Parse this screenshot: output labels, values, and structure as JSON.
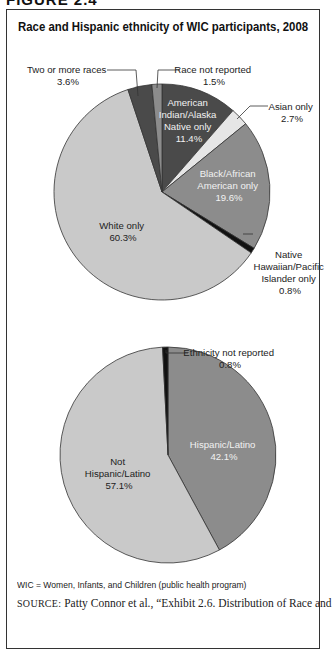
{
  "figure_label": "FIGURE 2.4",
  "title": "Race and Hispanic ethnicity of WIC participants, 2008",
  "note": "WIC = Women, Infants, and Children (public health program)",
  "source": {
    "label": "SOURCE:",
    "text": "Patty Connor et al., “Exhibit 2.6. Distribution of Race and"
  },
  "colors": {
    "dark": "#4a4a4a",
    "medium": "#8c8c8c",
    "light": "#c9c9c9",
    "lighter": "#e6e6e6",
    "black": "#111111",
    "outline": "#333333"
  },
  "chart_data": [
    {
      "type": "pie",
      "title": "Race",
      "start_angle": "12 o'clock, clockwise",
      "categories": [
        "American Indian/Alaska Native only",
        "Asian only",
        "Black/African American only",
        "Native Hawaiian/Pacific Islander only",
        "White only",
        "Two or more races",
        "Race not reported"
      ],
      "values": [
        11.4,
        2.7,
        19.6,
        0.8,
        60.3,
        3.6,
        1.5
      ],
      "unit": "%",
      "labels": [
        {
          "lines": [
            "American",
            "Indian/Alaska",
            "Native only",
            "11.4%"
          ]
        },
        {
          "lines": [
            "Asian only",
            "2.7%"
          ]
        },
        {
          "lines": [
            "Black/African",
            "American only",
            "19.6%"
          ]
        },
        {
          "lines": [
            "Native",
            "Hawaiian/Pacific",
            "Islander only",
            "0.8%"
          ]
        },
        {
          "lines": [
            "White only",
            "60.3%"
          ]
        },
        {
          "lines": [
            "Two or more races",
            "3.6%"
          ]
        },
        {
          "lines": [
            "Race not reported",
            "1.5%"
          ]
        }
      ]
    },
    {
      "type": "pie",
      "title": "Hispanic ethnicity",
      "start_angle": "12 o'clock, clockwise",
      "categories": [
        "Hispanic/Latino",
        "Not Hispanic/Latino",
        "Ethnicity not reported"
      ],
      "values": [
        42.1,
        57.1,
        0.8
      ],
      "unit": "%",
      "labels": [
        {
          "lines": [
            "Hispanic/Latino",
            "42.1%"
          ]
        },
        {
          "lines": [
            "Not",
            "Hispanic/Latino",
            "57.1%"
          ]
        },
        {
          "lines": [
            "Ethnicity not reported",
            "0.8%"
          ]
        }
      ]
    }
  ]
}
